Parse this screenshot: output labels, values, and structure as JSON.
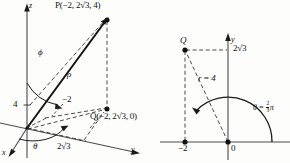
{
  "figure": {
    "ink_color": "#111111",
    "background": "#fdfdfc"
  },
  "left_diagram": {
    "name": "spherical-coordinates-3d",
    "axes": {
      "z_label": "z",
      "x_label": "x",
      "y_label": "y"
    },
    "points": {
      "P_label": "P(−2, 2√3, 4)",
      "Q_label": "Q(−2, 2√3, 0)"
    },
    "ticks": {
      "z_tick": "4",
      "x_projection": "−2",
      "y_projection": "2√3"
    },
    "angles": {
      "phi": "ϕ",
      "theta": "θ"
    },
    "segments": {
      "rho": "ρ"
    }
  },
  "right_diagram": {
    "name": "polar-coordinates-2d",
    "axes": {
      "y_label": "y",
      "origin_label": "0"
    },
    "points": {
      "Q_label": "Q"
    },
    "ticks": {
      "y_value": "2√3",
      "x_value": "−2"
    },
    "segments": {
      "r_label": "r = 4"
    },
    "angles": {
      "theta_eq_lead": "θ = ",
      "theta_frac_num": "2",
      "theta_frac_den": "3",
      "theta_eq_tail": "π"
    }
  }
}
